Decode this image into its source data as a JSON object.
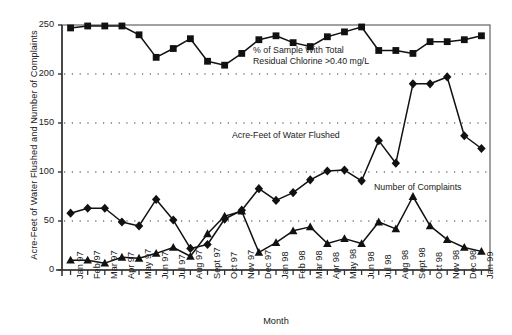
{
  "chart_data": {
    "type": "line",
    "title": "",
    "xlabel": "Month",
    "ylabel": "Acre-Feet of Water Flushed and Number of Complaints",
    "ylim": [
      0,
      250
    ],
    "yticks": [
      0,
      50,
      100,
      150,
      200,
      250
    ],
    "grid": "horizontal-dotted",
    "legend": "inline-annotations",
    "categories": [
      "Jan 97",
      "Feb 97",
      "Mar 97",
      "Apr 97",
      "May 97",
      "Jun 97",
      "Jul 97",
      "Aug 97",
      "Sept 97",
      "Oct 97",
      "Nov 97",
      "Dec 97",
      "Jan 98",
      "Feb 98",
      "Mar 98",
      "Apr 98",
      "May 98",
      "Jun 98",
      "Jul 98",
      "Aug 98",
      "Sept 98",
      "Oct 98",
      "Nov 98",
      "Dec 98",
      "Jan 99"
    ],
    "series": [
      {
        "name": "% of Sample With Total Residual Chlorine >0.40 mg/L",
        "marker": "square",
        "values": [
          247,
          249,
          249,
          249,
          240,
          217,
          226,
          236,
          213,
          209,
          221,
          235,
          239,
          232,
          228,
          238,
          243,
          248,
          224,
          224,
          221,
          233,
          233,
          235,
          239
        ]
      },
      {
        "name": "Acre-Feet of Water Flushed",
        "marker": "diamond",
        "values": [
          58,
          63,
          63,
          49,
          45,
          72,
          51,
          22,
          26,
          52,
          61,
          83,
          71,
          79,
          92,
          101,
          102,
          91,
          132,
          109,
          190,
          190,
          197,
          137,
          124
        ]
      },
      {
        "name": "Number of Complaints",
        "marker": "triangle",
        "values": [
          10,
          10,
          7,
          13,
          12,
          17,
          23,
          14,
          37,
          55,
          60,
          18,
          28,
          40,
          44,
          27,
          32,
          27,
          49,
          42,
          75,
          45,
          31,
          23,
          19
        ]
      }
    ],
    "annotations": [
      {
        "name": "chlorine-label",
        "line1": "% of Sample With Total",
        "line2": "Residual Chlorine >0.40 mg/L"
      },
      {
        "name": "acrefeet-label",
        "line1": "Acre-Feet of Water Flushed"
      },
      {
        "name": "complaints-label",
        "line1": "Number of Complaints"
      }
    ]
  },
  "axes": {
    "y_title": "Acre-Feet of Water Flushed and Number of Complaints",
    "x_title": "Month"
  }
}
